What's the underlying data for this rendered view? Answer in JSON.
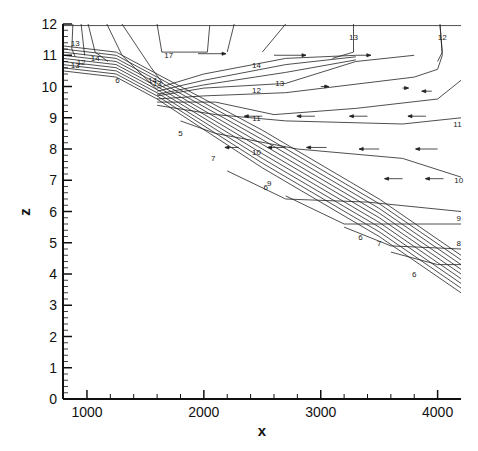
{
  "chart_data": {
    "type": "contour",
    "title": "",
    "xlabel": "x",
    "ylabel": "z",
    "xlim": [
      795,
      4200
    ],
    "ylim": [
      0,
      12
    ],
    "x_ticks": [
      1000,
      2000,
      3000,
      4000
    ],
    "x_tick_labels": [
      "1000",
      "2000",
      "3000",
      "4000"
    ],
    "y_ticks": [
      0,
      1,
      2,
      3,
      4,
      5,
      6,
      7,
      8,
      9,
      10,
      11,
      12
    ],
    "y_tick_labels": [
      "0",
      "1",
      "2",
      "3",
      "4",
      "5",
      "6",
      "7",
      "8",
      "9",
      "10",
      "11",
      "12"
    ],
    "grid": false,
    "legend": null,
    "bed_profile": [
      [
        795,
        10.5
      ],
      [
        1250,
        10.3
      ],
      [
        1600,
        9.6
      ],
      [
        2500,
        7.4
      ],
      [
        3500,
        5.2
      ],
      [
        4200,
        3.4
      ]
    ],
    "contour_levels": [
      5,
      6,
      7,
      8,
      9,
      10,
      11,
      12,
      13,
      14,
      17
    ],
    "contour_labels": [
      {
        "text": "13",
        "x": 900,
        "z": 11.4
      },
      {
        "text": "12",
        "x": 950,
        "z": 10.8
      },
      {
        "text": "13",
        "x": 900,
        "z": 10.7
      },
      {
        "text": "14",
        "x": 1070,
        "z": 10.9
      },
      {
        "text": "6",
        "x": 1260,
        "z": 10.2
      },
      {
        "text": "17",
        "x": 1700,
        "z": 11.0
      },
      {
        "text": "14",
        "x": 1560,
        "z": 10.2
      },
      {
        "text": "13",
        "x": 1600,
        "z": 10.1
      },
      {
        "text": "14",
        "x": 2450,
        "z": 10.7
      },
      {
        "text": "13",
        "x": 2650,
        "z": 10.1
      },
      {
        "text": "12",
        "x": 2450,
        "z": 9.9
      },
      {
        "text": "11",
        "x": 2450,
        "z": 9.0
      },
      {
        "text": "10",
        "x": 2450,
        "z": 7.9
      },
      {
        "text": "13",
        "x": 3280,
        "z": 11.6
      },
      {
        "text": "12",
        "x": 4040,
        "z": 11.6
      },
      {
        "text": "11",
        "x": 4170,
        "z": 8.8
      },
      {
        "text": "10",
        "x": 4180,
        "z": 7.0
      },
      {
        "text": "9",
        "x": 4180,
        "z": 5.8
      },
      {
        "text": "8",
        "x": 4180,
        "z": 5.0
      },
      {
        "text": "5",
        "x": 1800,
        "z": 8.5
      },
      {
        "text": "7",
        "x": 2080,
        "z": 7.7
      },
      {
        "text": "6",
        "x": 2530,
        "z": 6.8
      },
      {
        "text": "9",
        "x": 2560,
        "z": 6.9
      },
      {
        "text": "6",
        "x": 3340,
        "z": 5.2
      },
      {
        "text": "7",
        "x": 3500,
        "z": 5.0
      },
      {
        "text": "6",
        "x": 3800,
        "z": 4.0
      }
    ],
    "velocity_vectors": {
      "upper_layer_direction": "right",
      "lower_layer_direction": "left",
      "description": "Arrows point right (onshore) near z=10.5-11 and left (offshore) between z~6.5-9.5"
    }
  }
}
